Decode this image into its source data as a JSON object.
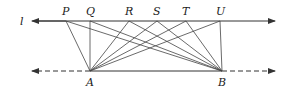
{
  "diagram": {
    "line_label": "l",
    "top_points": [
      {
        "name": "P",
        "x": 66
      },
      {
        "name": "Q",
        "x": 90
      },
      {
        "name": "R",
        "x": 129
      },
      {
        "name": "S",
        "x": 157
      },
      {
        "name": "T",
        "x": 186
      },
      {
        "name": "U",
        "x": 220
      }
    ],
    "bottom_points": [
      {
        "name": "A",
        "x": 90
      },
      {
        "name": "B",
        "x": 222
      }
    ],
    "top_line_y": 21,
    "bottom_line_y": 71,
    "stroke_color": "#333333"
  }
}
